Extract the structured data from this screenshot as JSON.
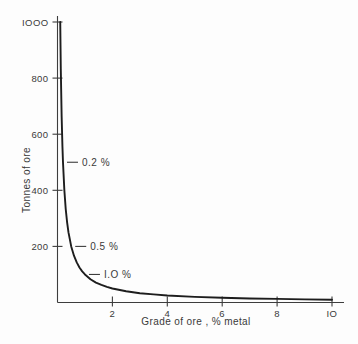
{
  "chart_data": {
    "type": "line",
    "title": "",
    "xlabel": "Grade of ore ,   % metal",
    "ylabel": "Tonnes of ore",
    "xlim": [
      0,
      10.4
    ],
    "ylim": [
      0,
      1050
    ],
    "grid": false,
    "legend": false,
    "x_ticks": [
      {
        "value": 2,
        "label": "2"
      },
      {
        "value": 4,
        "label": "4"
      },
      {
        "value": 6,
        "label": "6"
      },
      {
        "value": 8,
        "label": "8"
      },
      {
        "value": 10,
        "label": "IO"
      }
    ],
    "y_ticks": [
      {
        "value": 200,
        "label": "200"
      },
      {
        "value": 400,
        "label": "400"
      },
      {
        "value": 600,
        "label": "600"
      },
      {
        "value": 800,
        "label": "800"
      },
      {
        "value": 1000,
        "label": "IOOO"
      }
    ],
    "series": [
      {
        "name": "tonnes-of-ore-vs-grade",
        "x": [
          0.1,
          0.12,
          0.15,
          0.18,
          0.2,
          0.25,
          0.3,
          0.35,
          0.4,
          0.5,
          0.6,
          0.7,
          0.8,
          0.9,
          1.0,
          1.2,
          1.4,
          1.6,
          1.8,
          2.0,
          2.5,
          3.0,
          3.5,
          4.0,
          5.0,
          6.0,
          7.0,
          8.0,
          9.0,
          10.0
        ],
        "y": [
          1000,
          833,
          667,
          556,
          500,
          400,
          333,
          286,
          250,
          200,
          167,
          143,
          125,
          111,
          100,
          83,
          71,
          63,
          56,
          50,
          40,
          33,
          29,
          25,
          20,
          17,
          14,
          13,
          11,
          10
        ]
      }
    ],
    "annotations": [
      {
        "label": "0.2 %",
        "grade": 0.2,
        "tonnes": 500
      },
      {
        "label": "0.5 %",
        "grade": 0.5,
        "tonnes": 200
      },
      {
        "label": "I.O %",
        "grade": 1.0,
        "tonnes": 100
      }
    ]
  }
}
